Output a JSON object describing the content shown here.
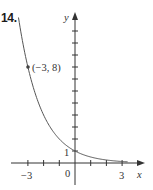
{
  "problem": {
    "number_label": "14."
  },
  "chart_data": {
    "type": "line",
    "title": "",
    "function": "y = (1/2)^x",
    "xlabel": "x",
    "ylabel": "y",
    "xlim": [
      -4,
      4.4
    ],
    "ylim": [
      -1.7,
      12.5
    ],
    "grid": false,
    "legend": null,
    "x_ticks": [
      -3,
      -2,
      -1,
      0,
      1,
      2,
      3
    ],
    "x_tick_labels": [
      {
        "value": -3,
        "label": "−3"
      },
      {
        "value": 0,
        "label": "0"
      },
      {
        "value": 3,
        "label": "3"
      }
    ],
    "y_ticks": [
      1,
      2,
      3,
      4,
      5,
      6,
      7,
      8,
      9,
      10,
      11
    ],
    "y_tick_labels": [
      {
        "value": 1,
        "label": "1"
      }
    ],
    "series": [
      {
        "name": "exponential decay",
        "x": [
          -3.6,
          -3,
          -2.5,
          -2,
          -1.5,
          -1,
          -0.5,
          0,
          0.5,
          1,
          1.5,
          2,
          2.5,
          3,
          3.3
        ],
        "y": [
          12.13,
          8,
          5.66,
          4,
          2.83,
          2,
          1.41,
          1,
          0.71,
          0.5,
          0.35,
          0.25,
          0.18,
          0.125,
          0.1
        ]
      }
    ],
    "annotations": [
      {
        "type": "point",
        "x": -3,
        "y": 8,
        "label": "(−3, 8)"
      }
    ]
  },
  "labels": {
    "x_axis": "x",
    "y_axis": "y",
    "point": "(−3, 8)",
    "tick_neg3": "−3",
    "tick_0": "0",
    "tick_3": "3",
    "tick_y1": "1"
  },
  "colors": {
    "axis": "#333333",
    "curve": "#555555",
    "text": "#333333"
  }
}
